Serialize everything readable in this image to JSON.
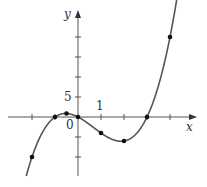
{
  "chart_data": {
    "type": "line",
    "title": "",
    "function": "y = x^3 - 2x^2 - 3x",
    "xlabel": "x",
    "ylabel": "y",
    "xlim": [
      -3.3,
      4.6
    ],
    "ylim": [
      -15,
      25
    ],
    "x_tick_labels": [
      {
        "value": 1,
        "label": "1"
      }
    ],
    "y_tick_labels": [
      {
        "value": 5,
        "label": "5"
      }
    ],
    "origin_label": "0",
    "x_ticks": [
      -2,
      -1,
      1,
      2,
      3,
      4
    ],
    "y_ticks": [
      -10,
      -5,
      5,
      10,
      15,
      20
    ],
    "points": [
      {
        "x": -2,
        "y": -10
      },
      {
        "x": -1,
        "y": 0
      },
      {
        "x": -0.5,
        "y": 0.875
      },
      {
        "x": 0,
        "y": 0
      },
      {
        "x": 1,
        "y": -4
      },
      {
        "x": 2,
        "y": -6
      },
      {
        "x": 3,
        "y": 0
      },
      {
        "x": 4,
        "y": 20
      }
    ],
    "grid": false,
    "legend": null,
    "colors": {
      "curve": "#555555",
      "axis": "#555555",
      "point": "#111111"
    }
  },
  "labels": {
    "x_axis": "x",
    "y_axis": "y",
    "tick_x_1": "1",
    "tick_y_5": "5",
    "origin": "0"
  }
}
